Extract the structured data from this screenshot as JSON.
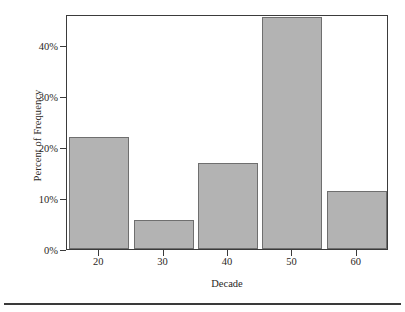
{
  "chart_data": {
    "type": "bar",
    "title": "",
    "subtitle": "",
    "xlabel": "Decade",
    "ylabel": "Percent of Frequency",
    "categories": [
      "20",
      "30",
      "40",
      "50",
      "60"
    ],
    "values": [
      22.0,
      5.7,
      16.8,
      45.5,
      11.3
    ],
    "ylim": [
      0,
      46
    ],
    "xlim": [
      15,
      65
    ],
    "ytick_values": [
      0,
      10,
      20,
      30,
      40
    ],
    "ytick_labels": [
      "0%",
      "10%",
      "20%",
      "30%",
      "40%"
    ],
    "xtick_labels": [
      "20",
      "30",
      "40",
      "50",
      "60"
    ],
    "grid": false,
    "legend": null,
    "legend_position": "none",
    "bar_color": "#b3b3b3",
    "bar_edge_color": "#6f6f6f",
    "axis_color": "#3b3b3b",
    "text_color": "#2b2724",
    "background_color": "#ffffff",
    "annotations": []
  },
  "figure": {
    "bottom_rule_color": "#3a3a3a"
  }
}
